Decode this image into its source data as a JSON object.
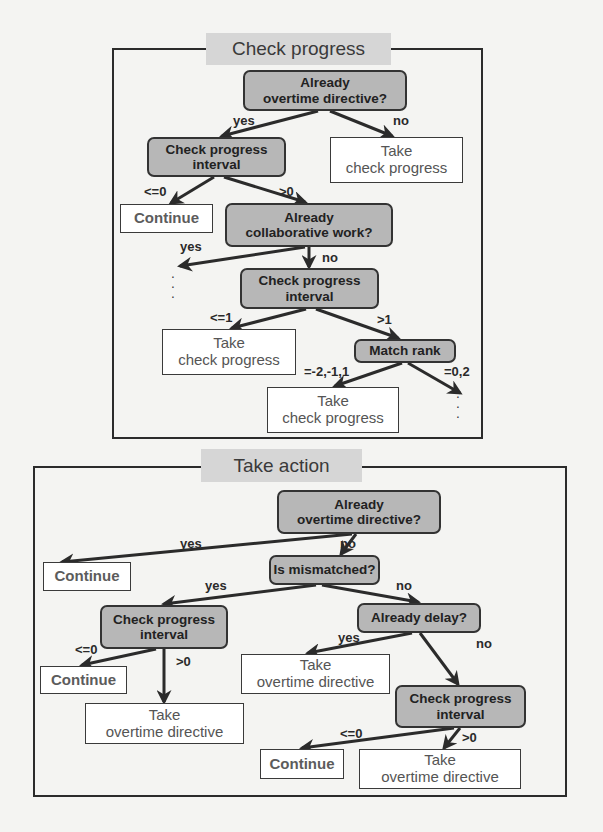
{
  "panels": {
    "check_progress": {
      "title": "Check progress",
      "nodes": {
        "already_overtime": "Already\novertime directive?",
        "cp_interval_1": "Check progress\ninterval",
        "take_cp_1": "Take\ncheck progress",
        "continue_1": "Continue",
        "already_collab": "Already\ncollaborative work?",
        "cp_interval_2": "Check progress\ninterval",
        "take_cp_2": "Take\ncheck progress",
        "match_rank": "Match rank",
        "take_cp_3": "Take\ncheck progress"
      },
      "edge_labels": {
        "yes_1": "yes",
        "no_1": "no",
        "le0": "<=0",
        "gt0": ">0",
        "yes_2": "yes",
        "no_2": "no",
        "le1": "<=1",
        "gt1": ">1",
        "rank_a": "=-2,-1,1",
        "rank_b": "=0,2"
      },
      "ellipsis": "⋮"
    },
    "take_action": {
      "title": "Take action",
      "nodes": {
        "already_overtime": "Already\novertime directive?",
        "continue_1": "Continue",
        "is_mismatched": "Is mismatched?",
        "cp_interval_1": "Check progress\ninterval",
        "already_delay": "Already delay?",
        "continue_2": "Continue",
        "take_ot_1": "Take\novertime directive",
        "cp_interval_2": "Check progress\ninterval",
        "take_ot_2": "Take\novertime directive",
        "continue_3": "Continue",
        "take_ot_3": "Take\novertime directive"
      },
      "edge_labels": {
        "yes_1": "yes",
        "no_1": "no",
        "yes_2": "yes",
        "no_2": "no",
        "yes_3": "yes",
        "no_3": "no",
        "le0_1": "<=0",
        "gt0_1": ">0",
        "le0_2": "<=0",
        "gt0_2": ">0"
      }
    }
  },
  "colors": {
    "decision_fill": "#b7b7b7",
    "title_fill": "#d6d6d6",
    "line": "#2b2b2b",
    "background": "#f4f4f2"
  }
}
